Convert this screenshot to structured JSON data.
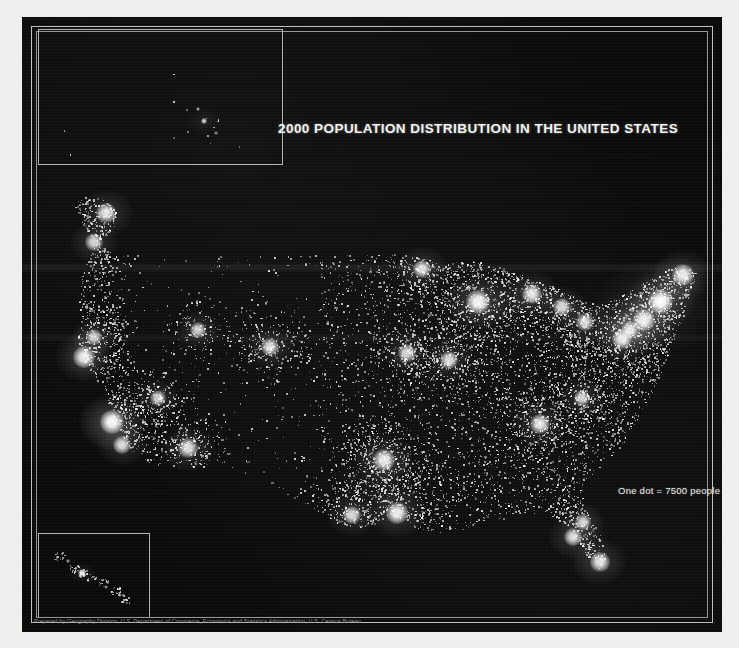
{
  "map": {
    "title": "2000 POPULATION DISTRIBUTION IN THE UNITED STATES",
    "legend": "One dot =  7500 people",
    "credit": "Prepared by Geography Division, U.S. Department of Commerce, Economics and Statistics Administration, U.S. Census Bureau.",
    "background_color": "#09090a",
    "dot_color": "#ffffff",
    "frame_color": "#cfcfcb",
    "insets": [
      {
        "name": "alaska-inset",
        "label": ""
      },
      {
        "name": "hawaii-inset",
        "label": ""
      }
    ]
  },
  "chart_data": {
    "type": "scatter",
    "title": "2000 POPULATION DISTRIBUTION IN THE UNITED STATES",
    "xlabel": "",
    "ylabel": "",
    "dot_value": 7500,
    "dot_value_label": "One dot =  7500 people",
    "note": "Dot-density map; one white dot represents 7500 people. Brightness corresponds to population concentration.",
    "metro_clusters": [
      {
        "name": "New York",
        "x": 638,
        "y": 284,
        "intensity": 1.0
      },
      {
        "name": "Philadelphia",
        "x": 622,
        "y": 303,
        "intensity": 0.82
      },
      {
        "name": "Boston",
        "x": 661,
        "y": 258,
        "intensity": 0.78
      },
      {
        "name": "Washington DC",
        "x": 600,
        "y": 322,
        "intensity": 0.76
      },
      {
        "name": "Baltimore",
        "x": 608,
        "y": 313,
        "intensity": 0.66
      },
      {
        "name": "Pittsburgh",
        "x": 563,
        "y": 305,
        "intensity": 0.58
      },
      {
        "name": "Cleveland",
        "x": 540,
        "y": 290,
        "intensity": 0.6
      },
      {
        "name": "Detroit",
        "x": 510,
        "y": 277,
        "intensity": 0.72
      },
      {
        "name": "Chicago",
        "x": 456,
        "y": 285,
        "intensity": 0.9
      },
      {
        "name": "Minneapolis",
        "x": 400,
        "y": 252,
        "intensity": 0.66
      },
      {
        "name": "St. Louis",
        "x": 427,
        "y": 343,
        "intensity": 0.62
      },
      {
        "name": "Kansas City",
        "x": 385,
        "y": 336,
        "intensity": 0.56
      },
      {
        "name": "Atlanta",
        "x": 518,
        "y": 407,
        "intensity": 0.72
      },
      {
        "name": "Charlotte",
        "x": 560,
        "y": 381,
        "intensity": 0.55
      },
      {
        "name": "Miami",
        "x": 578,
        "y": 545,
        "intensity": 0.7
      },
      {
        "name": "Tampa",
        "x": 551,
        "y": 520,
        "intensity": 0.62
      },
      {
        "name": "Orlando",
        "x": 561,
        "y": 505,
        "intensity": 0.52
      },
      {
        "name": "Houston",
        "x": 375,
        "y": 496,
        "intensity": 0.8
      },
      {
        "name": "Dallas",
        "x": 362,
        "y": 443,
        "intensity": 0.78
      },
      {
        "name": "San Antonio",
        "x": 330,
        "y": 498,
        "intensity": 0.62
      },
      {
        "name": "Denver",
        "x": 248,
        "y": 330,
        "intensity": 0.62
      },
      {
        "name": "Phoenix",
        "x": 166,
        "y": 431,
        "intensity": 0.68
      },
      {
        "name": "Las Vegas",
        "x": 136,
        "y": 381,
        "intensity": 0.5
      },
      {
        "name": "Los Angeles",
        "x": 90,
        "y": 405,
        "intensity": 0.95
      },
      {
        "name": "San Diego",
        "x": 100,
        "y": 428,
        "intensity": 0.62
      },
      {
        "name": "San Francisco",
        "x": 62,
        "y": 340,
        "intensity": 0.8
      },
      {
        "name": "Sacramento",
        "x": 72,
        "y": 320,
        "intensity": 0.52
      },
      {
        "name": "Portland",
        "x": 72,
        "y": 225,
        "intensity": 0.58
      },
      {
        "name": "Seattle",
        "x": 84,
        "y": 196,
        "intensity": 0.7
      },
      {
        "name": "Salt Lake City",
        "x": 176,
        "y": 313,
        "intensity": 0.52
      },
      {
        "name": "Honolulu",
        "x": 60,
        "y": 556,
        "intensity": 0.6
      },
      {
        "name": "Anchorage",
        "x": 182,
        "y": 104,
        "intensity": 0.4
      }
    ]
  }
}
